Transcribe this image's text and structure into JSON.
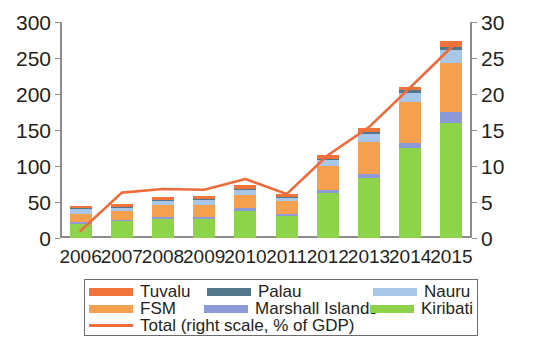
{
  "chart_data": {
    "type": "bar",
    "stacked": true,
    "title": "",
    "subtitle": "",
    "xlabel": "",
    "ylabel": "",
    "ylabel_right": "",
    "categories": [
      "2006",
      "2007",
      "2008",
      "2009",
      "2010",
      "2011",
      "2012",
      "2013",
      "2014",
      "2015"
    ],
    "ylim": [
      0,
      300
    ],
    "yticks": [
      0,
      50,
      100,
      150,
      200,
      250,
      300
    ],
    "ylim_right": [
      0,
      30
    ],
    "yticks_right": [
      0,
      5,
      10,
      15,
      20,
      25,
      30
    ],
    "grid": false,
    "legend_position": "bottom",
    "series": [
      {
        "name": "Kiribati",
        "color": "#8ed44a",
        "values": [
          20,
          23,
          27,
          26,
          38,
          30,
          62,
          83,
          125,
          160
        ]
      },
      {
        "name": "Marshall Islands",
        "color": "#8c9bd8",
        "values": [
          2,
          2,
          2,
          3,
          3,
          4,
          5,
          6,
          7,
          15
        ]
      },
      {
        "name": "FSM",
        "color": "#f5a04e",
        "values": [
          12,
          13,
          17,
          17,
          19,
          17,
          33,
          44,
          57,
          68
        ]
      },
      {
        "name": "Nauru",
        "color": "#a8c6e8",
        "values": [
          7,
          4,
          6,
          7,
          7,
          5,
          9,
          12,
          13,
          18
        ]
      },
      {
        "name": "Palau",
        "color": "#53788c",
        "values": [
          1,
          1,
          1,
          1,
          1,
          1,
          1,
          2,
          3,
          4
        ]
      },
      {
        "name": "Tuvalu",
        "color": "#f0733c",
        "values": [
          3,
          4,
          4,
          4,
          5,
          4,
          5,
          6,
          5,
          9
        ]
      }
    ],
    "line_series": {
      "name": "Total (right scale, % of GDP)",
      "color": "#ee6c3c",
      "axis": "right",
      "units": "% of GDP",
      "values": [
        1.0,
        6.3,
        6.8,
        6.7,
        8.2,
        6.1,
        11.5,
        15.4,
        20.9,
        26.5
      ]
    }
  },
  "axes": {
    "left_ticks": [
      "0",
      "50",
      "100",
      "150",
      "200",
      "250",
      "300"
    ],
    "right_ticks": [
      "0",
      "5",
      "10",
      "15",
      "20",
      "25",
      "30"
    ],
    "x_ticks": [
      "2006",
      "2007",
      "2008",
      "2009",
      "2010",
      "2011",
      "2012",
      "2013",
      "2014",
      "2015"
    ]
  },
  "legend": {
    "rows": [
      [
        {
          "label": "Tuvalu",
          "color": "#f0733c",
          "type": "swatch"
        },
        {
          "label": "Palau",
          "color": "#53788c",
          "type": "swatch"
        },
        {
          "label": "Nauru",
          "color": "#a8c6e8",
          "type": "swatch"
        }
      ],
      [
        {
          "label": "FSM",
          "color": "#f5a04e",
          "type": "swatch"
        },
        {
          "label": "Marshall Islands",
          "color": "#8c9bd8",
          "type": "swatch"
        },
        {
          "label": "Kiribati",
          "color": "#8ed44a",
          "type": "swatch"
        }
      ],
      [
        {
          "label": "Total (right scale, % of GDP)",
          "color": "#ee6c3c",
          "type": "line"
        }
      ]
    ]
  }
}
